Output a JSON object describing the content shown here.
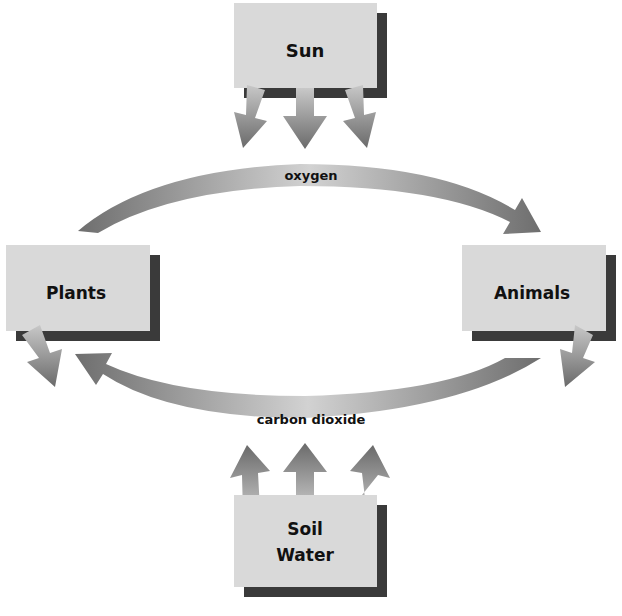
{
  "diagram": {
    "nodes": {
      "sun": {
        "label": "Sun"
      },
      "plants": {
        "label": "Plants"
      },
      "animals": {
        "label": "Animals"
      },
      "soil_water": {
        "line1": "Soil",
        "line2": "Water"
      }
    },
    "edges": {
      "oxygen": {
        "label": "oxygen",
        "from": "Plants",
        "to": "Animals"
      },
      "carbon_dioxide": {
        "label": "carbon dioxide",
        "from": "Animals",
        "to": "Plants"
      }
    },
    "colors": {
      "box_fill": "#d9d9d9",
      "box_shadow": "#3a3a3a",
      "arrow_dark": "#6e6e6e",
      "arrow_light": "#d0d0d0",
      "text": "#111111"
    }
  }
}
